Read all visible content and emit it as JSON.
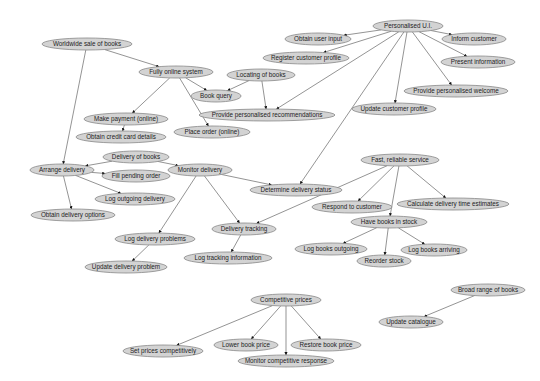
{
  "diagram": {
    "colors": {
      "node_fill": "#d3d3d3",
      "node_stroke": "#888888",
      "edge": "#666666",
      "text": "#222222"
    },
    "nodes": [
      {
        "id": "worldwide",
        "label": "Worldwide sale of books",
        "x": 87,
        "y": 44,
        "rx": 45
      },
      {
        "id": "fully_online",
        "label": "Fully online system",
        "x": 176,
        "y": 72,
        "rx": 37
      },
      {
        "id": "book_query",
        "label": "Book query",
        "x": 216,
        "y": 96,
        "rx": 25
      },
      {
        "id": "locating",
        "label": "Locating of books",
        "x": 261,
        "y": 75,
        "rx": 34
      },
      {
        "id": "make_payment",
        "label": "Make payment (online)",
        "x": 126,
        "y": 119,
        "rx": 42
      },
      {
        "id": "provide_recs",
        "label": "Provide personalised recommendations",
        "x": 267,
        "y": 115,
        "rx": 68
      },
      {
        "id": "obtain_cc",
        "label": "Obtain credit card details",
        "x": 121,
        "y": 137,
        "rx": 45
      },
      {
        "id": "place_order",
        "label": "Place order (online)",
        "x": 212,
        "y": 132,
        "rx": 38
      },
      {
        "id": "personalised_ui",
        "label": "Personalised U.I.",
        "x": 408,
        "y": 26,
        "rx": 35
      },
      {
        "id": "obtain_input",
        "label": "Obtain user input",
        "x": 318,
        "y": 39,
        "rx": 33
      },
      {
        "id": "inform_customer",
        "label": "Inform customer",
        "x": 474,
        "y": 39,
        "rx": 32
      },
      {
        "id": "register_profile",
        "label": "Register customer profile",
        "x": 306,
        "y": 58,
        "rx": 43
      },
      {
        "id": "present_info",
        "label": "Present information",
        "x": 478,
        "y": 62,
        "rx": 37
      },
      {
        "id": "personalised_welcome",
        "label": "Provide personalised welcome",
        "x": 456,
        "y": 91,
        "rx": 52
      },
      {
        "id": "update_profile",
        "label": "Update customer profile",
        "x": 394,
        "y": 109,
        "rx": 42
      },
      {
        "id": "delivery_of_books",
        "label": "Delivery of books",
        "x": 136,
        "y": 157,
        "rx": 33
      },
      {
        "id": "arrange_delivery",
        "label": "Arrange delivery",
        "x": 62,
        "y": 170,
        "rx": 32
      },
      {
        "id": "fill_pending",
        "label": "Fill pending order",
        "x": 136,
        "y": 176,
        "rx": 34
      },
      {
        "id": "monitor_delivery",
        "label": "Monitor delivery",
        "x": 200,
        "y": 170,
        "rx": 32
      },
      {
        "id": "log_outgoing_delivery",
        "label": "Log outgoing delivery",
        "x": 135,
        "y": 199,
        "rx": 40
      },
      {
        "id": "determine_status",
        "label": "Determine delivery status",
        "x": 296,
        "y": 190,
        "rx": 46
      },
      {
        "id": "obtain_delivery_options",
        "label": "Obtain delivery options",
        "x": 73,
        "y": 215,
        "rx": 42
      },
      {
        "id": "fast_reliable",
        "label": "Fast, reliable service",
        "x": 400,
        "y": 160,
        "rx": 39
      },
      {
        "id": "respond_customer",
        "label": "Respond to customer",
        "x": 352,
        "y": 207,
        "rx": 40
      },
      {
        "id": "calc_delivery",
        "label": "Calculate delivery time estimates",
        "x": 453,
        "y": 204,
        "rx": 56
      },
      {
        "id": "have_books",
        "label": "Have books in stock",
        "x": 389,
        "y": 222,
        "rx": 38
      },
      {
        "id": "delivery_tracking",
        "label": "Delivery tracking",
        "x": 244,
        "y": 229,
        "rx": 32
      },
      {
        "id": "log_delivery_problems",
        "label": "Log delivery problems",
        "x": 155,
        "y": 239,
        "rx": 40
      },
      {
        "id": "log_books_outgoing",
        "label": "Log books outgoing",
        "x": 331,
        "y": 249,
        "rx": 36
      },
      {
        "id": "log_books_arriving",
        "label": "Log books arriving",
        "x": 434,
        "y": 250,
        "rx": 33
      },
      {
        "id": "reorder_stock",
        "label": "Reorder stock",
        "x": 384,
        "y": 261,
        "rx": 27
      },
      {
        "id": "log_tracking",
        "label": "Log tracking information",
        "x": 228,
        "y": 258,
        "rx": 44
      },
      {
        "id": "update_delivery_problem",
        "label": "Update delivery problem",
        "x": 126,
        "y": 267,
        "rx": 41
      },
      {
        "id": "broad_range",
        "label": "Broad range of books",
        "x": 488,
        "y": 290,
        "rx": 37
      },
      {
        "id": "update_catalogue",
        "label": "Update catalogue",
        "x": 411,
        "y": 322,
        "rx": 32
      },
      {
        "id": "competitive_prices",
        "label": "Competitive prices",
        "x": 286,
        "y": 300,
        "rx": 35
      },
      {
        "id": "set_prices",
        "label": "Set prices competitively",
        "x": 163,
        "y": 351,
        "rx": 40
      },
      {
        "id": "lower_price",
        "label": "Lower book price",
        "x": 246,
        "y": 345,
        "rx": 32
      },
      {
        "id": "restore_price",
        "label": "Restore book price",
        "x": 326,
        "y": 345,
        "rx": 35
      },
      {
        "id": "monitor_competitive",
        "label": "Monitor competitive response",
        "x": 286,
        "y": 361,
        "rx": 48
      }
    ],
    "edges": [
      [
        "worldwide",
        "fully_online"
      ],
      [
        "worldwide",
        "arrange_delivery"
      ],
      [
        "fully_online",
        "book_query"
      ],
      [
        "fully_online",
        "make_payment"
      ],
      [
        "fully_online",
        "place_order"
      ],
      [
        "locating",
        "book_query"
      ],
      [
        "locating",
        "provide_recs"
      ],
      [
        "make_payment",
        "obtain_cc"
      ],
      [
        "personalised_ui",
        "obtain_input"
      ],
      [
        "personalised_ui",
        "inform_customer"
      ],
      [
        "personalised_ui",
        "register_profile"
      ],
      [
        "personalised_ui",
        "present_info"
      ],
      [
        "personalised_ui",
        "personalised_welcome"
      ],
      [
        "personalised_ui",
        "update_profile"
      ],
      [
        "personalised_ui",
        "provide_recs"
      ],
      [
        "personalised_ui",
        "determine_status"
      ],
      [
        "delivery_of_books",
        "arrange_delivery"
      ],
      [
        "delivery_of_books",
        "monitor_delivery"
      ],
      [
        "arrange_delivery",
        "fill_pending"
      ],
      [
        "arrange_delivery",
        "log_outgoing_delivery"
      ],
      [
        "arrange_delivery",
        "obtain_delivery_options"
      ],
      [
        "monitor_delivery",
        "determine_status"
      ],
      [
        "monitor_delivery",
        "delivery_tracking"
      ],
      [
        "monitor_delivery",
        "log_delivery_problems"
      ],
      [
        "log_delivery_problems",
        "update_delivery_problem"
      ],
      [
        "delivery_tracking",
        "log_tracking"
      ],
      [
        "fast_reliable",
        "respond_customer"
      ],
      [
        "fast_reliable",
        "calc_delivery"
      ],
      [
        "fast_reliable",
        "have_books"
      ],
      [
        "fast_reliable",
        "delivery_tracking"
      ],
      [
        "have_books",
        "log_books_outgoing"
      ],
      [
        "have_books",
        "reorder_stock"
      ],
      [
        "have_books",
        "log_books_arriving"
      ],
      [
        "broad_range",
        "update_catalogue"
      ],
      [
        "competitive_prices",
        "set_prices"
      ],
      [
        "competitive_prices",
        "lower_price"
      ],
      [
        "competitive_prices",
        "restore_price"
      ],
      [
        "competitive_prices",
        "monitor_competitive"
      ]
    ]
  }
}
